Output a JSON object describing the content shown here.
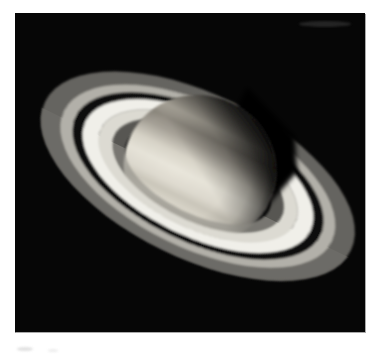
{
  "page": {
    "background_color": "#ffffff"
  },
  "photo": {
    "subject": "Saturn",
    "type": "telescope photograph",
    "description": "Monochrome telescope photograph of the planet Saturn. The globe shows soft cloud bands and a darkened upper-right limb. The ring system sweeps from upper left to lower right: a dim outer A ring, the dark Cassini Division, the broad bright B ring and a faint inner C ring. The planet's shadow cuts across the rings where they pass behind the globe at the upper right, and the near side of the rings crosses in front of the lower-left limb.",
    "background_color": "#060606",
    "edge_color": "#9e9e9e"
  },
  "sky": {
    "color": "#060606"
  },
  "rings": {
    "shadow_color": "#040404",
    "bands": [
      {
        "name": "A ring outer",
        "color": "#6c6b67",
        "opacity": 0.92
      },
      {
        "name": "A ring inner",
        "color": "#b2b0a9",
        "opacity": 1
      },
      {
        "name": "Cassini Division",
        "color": "#070707",
        "opacity": 1
      },
      {
        "name": "B ring outer",
        "color": "#f0efe9",
        "opacity": 1
      },
      {
        "name": "B ring inner",
        "color": "#dcdad2",
        "opacity": 1
      },
      {
        "name": "C ring",
        "color": "#8e8c85",
        "opacity": 0.6
      }
    ]
  },
  "planet": {
    "bands": [
      {
        "offset": 0.0,
        "name": "north polar region",
        "color": "#8a877f"
      },
      {
        "offset": 0.1,
        "name": "upper band",
        "color": "#a29d92"
      },
      {
        "offset": 0.2,
        "name": "upper light zone",
        "color": "#c2bdb0"
      },
      {
        "offset": 0.28,
        "name": "dark temperate band",
        "color": "#938e84"
      },
      {
        "offset": 0.36,
        "name": "band edge",
        "color": "#a8a399"
      },
      {
        "offset": 0.47,
        "name": "light zone",
        "color": "#d9d5c9"
      },
      {
        "offset": 0.57,
        "name": "bright equatorial zone",
        "color": "#e9e6db"
      },
      {
        "offset": 0.67,
        "name": "lower light zone",
        "color": "#dfdbd0"
      },
      {
        "offset": 0.73,
        "name": "subtle lower band",
        "color": "#ccc8bc"
      },
      {
        "offset": 0.79,
        "name": "lower zone",
        "color": "#dad6ca"
      },
      {
        "offset": 0.87,
        "name": "south band",
        "color": "#c6c1b5"
      },
      {
        "offset": 1.0,
        "name": "south limb",
        "color": "#97938a"
      }
    ]
  },
  "artifacts": {
    "streak_color": "#4a4a4a",
    "smudge_color": "#d9d9d9",
    "smudge_note": "faint remnant of cropped caption text below the photo"
  }
}
